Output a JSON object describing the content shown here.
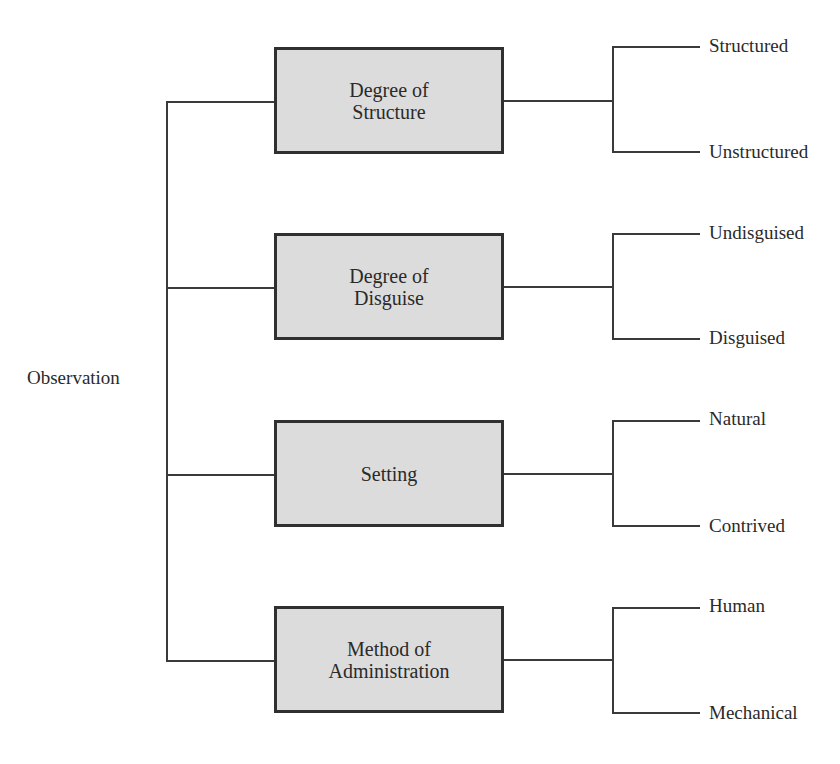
{
  "diagram": {
    "root": {
      "label": "Observation"
    },
    "categories": [
      {
        "label": "Degree of\nStructure",
        "line1": "Degree of",
        "line2": "Structure",
        "options": [
          "Structured",
          "Unstructured"
        ]
      },
      {
        "label": "Degree of\nDisguise",
        "line1": "Degree of",
        "line2": "Disguise",
        "options": [
          "Undisguised",
          "Disguised"
        ]
      },
      {
        "label": "Setting",
        "line1": "Setting",
        "line2": "",
        "options": [
          "Natural",
          "Contrived"
        ]
      },
      {
        "label": "Method of\nAdministration",
        "line1": "Method of",
        "line2": "Administration",
        "options": [
          "Human",
          "Mechanical"
        ]
      }
    ],
    "colors": {
      "box_fill": "#dcdcdc",
      "box_border": "#303030",
      "line": "#3a3a3a"
    }
  }
}
